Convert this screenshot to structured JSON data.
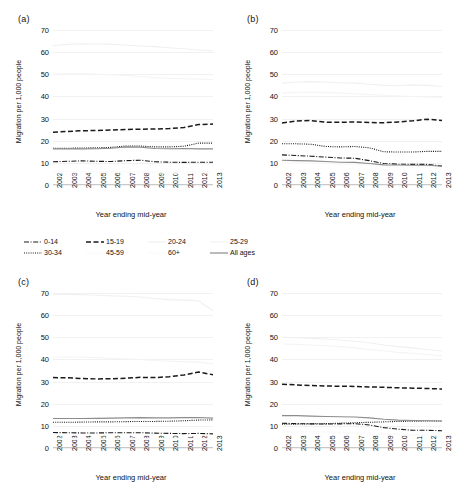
{
  "figure": {
    "y_axis_title": "Migration per 1,000 people",
    "x_axis_title": "Year ending mid-year",
    "y_ticks": [
      "0",
      "10",
      "20",
      "30",
      "40",
      "50",
      "60",
      "70"
    ],
    "x_ticks": [
      "2002",
      "2003",
      "2004",
      "2005",
      "2006",
      "2007",
      "2008",
      "2009",
      "2010",
      "2011",
      "2012",
      "2013"
    ]
  },
  "panels": [
    {
      "tag": "(a)"
    },
    {
      "tag": "(b)"
    },
    {
      "tag": "(c)"
    },
    {
      "tag": "(d)"
    }
  ],
  "legend": {
    "rows": [
      [
        {
          "label": "0-14",
          "dash": "dashdot",
          "color": "#1a1a1a",
          "width": 1.2
        },
        {
          "label": "15-19",
          "dash": "dashed",
          "color": "#1a1a1a",
          "width": 1.6
        },
        {
          "label": "20-24",
          "dash": "solid",
          "color": "#f0f0f0",
          "width": 1.0
        },
        {
          "label": "25-29",
          "dash": "solid",
          "color": "#f4f4f4",
          "width": 1.0
        }
      ],
      [
        {
          "label": "30-34",
          "dash": "dotted",
          "color": "#1a1a1a",
          "width": 1.1
        },
        {
          "label": "45-59",
          "dash": "solid",
          "color": "#fafafa",
          "width": 1.0
        },
        {
          "label": "60+",
          "dash": "solid",
          "color": "#fbfbfb",
          "width": 1.0
        },
        {
          "label": "All ages",
          "dash": "solid",
          "color": "#8c8c8c",
          "width": 1.0
        }
      ]
    ]
  },
  "chart_data": {
    "type": "line",
    "title": "",
    "xlabel": "Year ending mid-year",
    "ylabel": "Migration per 1,000 people",
    "x": [
      2002,
      2003,
      2004,
      2005,
      2006,
      2007,
      2008,
      2009,
      2010,
      2011,
      2012,
      2013
    ],
    "ylim": [
      0,
      70
    ],
    "ytick_step": 10,
    "grid": true,
    "legend_position": "below-panel-a-and-b",
    "panels": [
      {
        "tag": "(a)",
        "series": [
          {
            "name": "0-14",
            "style": "dashdot",
            "color": "#1a1a1a",
            "values": [
              10.5,
              10.7,
              10.9,
              10.7,
              10.6,
              11.0,
              11.2,
              10.5,
              10.3,
              10.2,
              10.3,
              10.3
            ]
          },
          {
            "name": "15-19",
            "style": "dashed",
            "color": "#1a1a1a",
            "values": [
              23.8,
              24.2,
              24.5,
              24.6,
              24.8,
              25.1,
              25.2,
              25.3,
              25.5,
              26.0,
              27.3,
              27.5
            ]
          },
          {
            "name": "20-24",
            "style": "solid",
            "color": "#f0f0f0",
            "values": [
              63.0,
              63.5,
              63.8,
              63.7,
              63.5,
              63.2,
              62.8,
              62.5,
              62.0,
              61.5,
              61.0,
              60.5
            ]
          },
          {
            "name": "25-29",
            "style": "solid",
            "color": "#f4f4f4",
            "values": [
              50.0,
              50.2,
              50.3,
              50.0,
              49.8,
              49.5,
              49.0,
              48.5,
              48.2,
              48.0,
              47.8,
              47.5
            ]
          },
          {
            "name": "30-34",
            "style": "dotted",
            "color": "#1a1a1a",
            "values": [
              16.6,
              16.6,
              16.7,
              16.8,
              17.0,
              17.6,
              17.6,
              17.2,
              17.2,
              17.5,
              18.9,
              18.9
            ]
          },
          {
            "name": "45-59",
            "style": "solid",
            "color": "#fafafa",
            "values": [
              6.0,
              6.0,
              6.1,
              6.1,
              6.1,
              6.2,
              6.2,
              6.0,
              5.9,
              5.9,
              6.0,
              6.0
            ]
          },
          {
            "name": "60+",
            "style": "solid",
            "color": "#fbfbfb",
            "values": [
              5.4,
              5.4,
              5.5,
              5.5,
              5.5,
              5.6,
              5.6,
              5.4,
              5.3,
              5.3,
              5.4,
              5.4
            ]
          },
          {
            "name": "All ages",
            "style": "solid",
            "color": "#8c8c8c",
            "values": [
              16.3,
              16.3,
              16.3,
              16.4,
              16.6,
              17.2,
              17.1,
              16.5,
              16.4,
              16.5,
              16.3,
              16.3
            ]
          }
        ]
      },
      {
        "tag": "(b)",
        "series": [
          {
            "name": "0-14",
            "style": "dashdot",
            "color": "#1a1a1a",
            "values": [
              13.6,
              13.3,
              13.0,
              12.6,
              12.2,
              12.1,
              11.0,
              9.7,
              9.4,
              9.3,
              9.3,
              8.6
            ]
          },
          {
            "name": "15-19",
            "style": "dashed",
            "color": "#1a1a1a",
            "values": [
              28.0,
              28.9,
              29.1,
              28.4,
              28.3,
              28.5,
              28.2,
              28.1,
              28.5,
              29.0,
              29.7,
              29.1
            ]
          },
          {
            "name": "20-24",
            "style": "solid",
            "color": "#f0f0f0",
            "values": [
              46.0,
              46.5,
              46.7,
              46.5,
              46.2,
              46.0,
              45.5,
              45.0,
              44.8,
              45.2,
              45.0,
              44.5
            ]
          },
          {
            "name": "25-29",
            "style": "solid",
            "color": "#f4f4f4",
            "values": [
              41.5,
              41.8,
              42.0,
              41.7,
              41.5,
              41.2,
              40.8,
              40.5,
              40.2,
              40.0,
              39.8,
              39.5
            ]
          },
          {
            "name": "30-34",
            "style": "dotted",
            "color": "#1a1a1a",
            "values": [
              18.6,
              18.6,
              18.4,
              17.4,
              17.2,
              17.4,
              16.8,
              15.0,
              14.9,
              14.9,
              15.2,
              15.2
            ]
          },
          {
            "name": "45-59",
            "style": "solid",
            "color": "#fafafa",
            "values": [
              10.4,
              10.4,
              10.3,
              10.0,
              9.8,
              9.7,
              9.2,
              8.7,
              8.6,
              8.5,
              8.5,
              8.3
            ]
          },
          {
            "name": "60+",
            "style": "solid",
            "color": "#fbfbfb",
            "values": [
              9.8,
              9.8,
              9.7,
              9.5,
              9.3,
              9.2,
              8.8,
              8.3,
              8.2,
              8.1,
              8.1,
              7.9
            ]
          },
          {
            "name": "All ages",
            "style": "solid",
            "color": "#8c8c8c",
            "values": [
              11.2,
              11.0,
              10.9,
              10.6,
              10.3,
              10.2,
              9.7,
              9.1,
              9.0,
              8.9,
              8.9,
              8.5
            ]
          }
        ]
      },
      {
        "tag": "(c)",
        "series": [
          {
            "name": "0-14",
            "style": "dashdot",
            "color": "#1a1a1a",
            "values": [
              7.0,
              6.9,
              6.8,
              6.8,
              6.9,
              6.9,
              6.9,
              6.7,
              6.6,
              6.5,
              6.6,
              6.4
            ]
          },
          {
            "name": "15-19",
            "style": "dashed",
            "color": "#1a1a1a",
            "values": [
              31.8,
              31.7,
              31.4,
              31.2,
              31.3,
              31.5,
              31.9,
              31.8,
              32.2,
              33.0,
              34.3,
              33.1
            ]
          },
          {
            "name": "20-24",
            "style": "solid",
            "color": "#f0f0f0",
            "values": [
              69.5,
              69.4,
              69.2,
              69.0,
              68.7,
              68.5,
              68.2,
              67.5,
              67.0,
              66.8,
              66.5,
              62.0
            ]
          },
          {
            "name": "25-29",
            "style": "solid",
            "color": "#f4f4f4",
            "values": [
              41.0,
              41.2,
              41.0,
              40.8,
              40.5,
              40.3,
              40.0,
              39.5,
              39.2,
              39.0,
              38.8,
              38.0
            ]
          },
          {
            "name": "30-34",
            "style": "dotted",
            "color": "#1a1a1a",
            "values": [
              11.6,
              11.6,
              11.7,
              11.8,
              11.8,
              11.9,
              12.0,
              12.0,
              12.1,
              12.3,
              12.6,
              12.7
            ]
          },
          {
            "name": "45-59",
            "style": "solid",
            "color": "#fafafa",
            "values": [
              4.4,
              4.4,
              4.4,
              4.4,
              4.4,
              4.4,
              4.4,
              4.3,
              4.3,
              4.3,
              4.3,
              4.2
            ]
          },
          {
            "name": "60+",
            "style": "solid",
            "color": "#fbfbfb",
            "values": [
              4.0,
              4.0,
              4.0,
              4.0,
              4.0,
              4.0,
              4.0,
              3.9,
              3.9,
              3.9,
              3.9,
              3.8
            ]
          },
          {
            "name": "All ages",
            "style": "solid",
            "color": "#8c8c8c",
            "values": [
              13.3,
              13.3,
              13.3,
              13.4,
              13.5,
              13.6,
              13.7,
              13.6,
              13.6,
              13.7,
              13.8,
              13.5
            ]
          }
        ]
      },
      {
        "tag": "(d)",
        "series": [
          {
            "name": "0-14",
            "style": "dashdot",
            "color": "#1a1a1a",
            "values": [
              11.2,
              11.0,
              10.9,
              10.8,
              10.9,
              11.0,
              10.4,
              9.2,
              8.5,
              8.0,
              8.0,
              7.8
            ]
          },
          {
            "name": "15-19",
            "style": "dashed",
            "color": "#1a1a1a",
            "values": [
              28.8,
              28.5,
              28.2,
              28.0,
              27.9,
              27.8,
              27.6,
              27.4,
              27.2,
              27.0,
              26.9,
              26.6
            ]
          },
          {
            "name": "20-24",
            "style": "solid",
            "color": "#f0f0f0",
            "values": [
              50.0,
              49.8,
              49.5,
              49.2,
              48.8,
              48.2,
              47.5,
              46.5,
              45.8,
              45.2,
              44.5,
              43.8
            ]
          },
          {
            "name": "25-29",
            "style": "solid",
            "color": "#f4f4f4",
            "values": [
              47.0,
              46.8,
              46.5,
              46.2,
              45.8,
              45.2,
              44.5,
              43.8,
              43.2,
              42.8,
              42.2,
              41.6
            ]
          },
          {
            "name": "30-34",
            "style": "dotted",
            "color": "#1a1a1a",
            "values": [
              10.8,
              10.8,
              10.9,
              11.0,
              11.2,
              11.4,
              11.6,
              11.8,
              12.0,
              12.1,
              12.2,
              12.2
            ]
          },
          {
            "name": "45-59",
            "style": "solid",
            "color": "#fafafa",
            "values": [
              7.6,
              7.5,
              7.4,
              7.3,
              7.2,
              7.1,
              6.9,
              6.5,
              6.2,
              6.0,
              5.9,
              5.8
            ]
          },
          {
            "name": "60+",
            "style": "solid",
            "color": "#fbfbfb",
            "values": [
              7.0,
              6.9,
              6.8,
              6.8,
              6.7,
              6.6,
              6.4,
              6.1,
              5.9,
              5.7,
              5.6,
              5.5
            ]
          },
          {
            "name": "All ages",
            "style": "solid",
            "color": "#8c8c8c",
            "values": [
              14.6,
              14.6,
              14.4,
              14.2,
              14.1,
              14.0,
              13.6,
              13.0,
              12.6,
              12.4,
              12.3,
              12.2
            ]
          }
        ]
      }
    ]
  }
}
